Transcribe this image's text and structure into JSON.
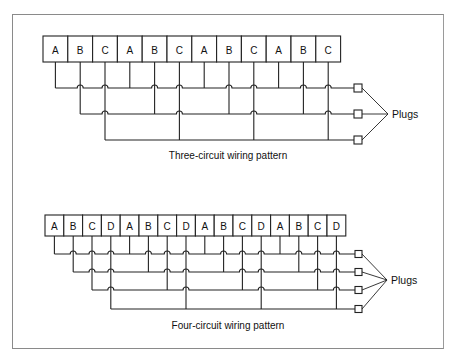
{
  "diagrams": [
    {
      "id": "three-circuit",
      "caption": "Three-circuit wiring pattern",
      "plugs_label": "Plugs",
      "circuits": [
        "A",
        "B",
        "C"
      ],
      "outlets": [
        "A",
        "B",
        "C",
        "A",
        "B",
        "C",
        "A",
        "B",
        "C",
        "A",
        "B",
        "C"
      ],
      "layout": {
        "box_left": 43,
        "box_top": 36,
        "box_width": 24.8,
        "box_height": 26,
        "bus_y": [
          88,
          114,
          140
        ],
        "plug_x": 354,
        "plug_size": 8,
        "leader_tip": [
          388,
          114
        ],
        "plugs_text_pos": [
          392,
          114
        ],
        "caption_pos": [
          228,
          159
        ]
      }
    },
    {
      "id": "four-circuit",
      "caption": "Four-circuit wiring pattern",
      "plugs_label": "Plugs",
      "circuits": [
        "A",
        "B",
        "C",
        "D"
      ],
      "outlets": [
        "A",
        "B",
        "C",
        "D",
        "A",
        "B",
        "C",
        "D",
        "A",
        "B",
        "C",
        "D",
        "A",
        "B",
        "C",
        "D"
      ],
      "layout": {
        "box_left": 45,
        "box_top": 215,
        "box_width": 18.8,
        "box_height": 21,
        "bus_y": [
          254,
          272,
          290,
          309
        ],
        "plug_x": 355,
        "plug_size": 7,
        "leader_tip": [
          387,
          280
        ],
        "plugs_text_pos": [
          391,
          280
        ],
        "caption_pos": [
          228,
          329
        ]
      }
    }
  ]
}
